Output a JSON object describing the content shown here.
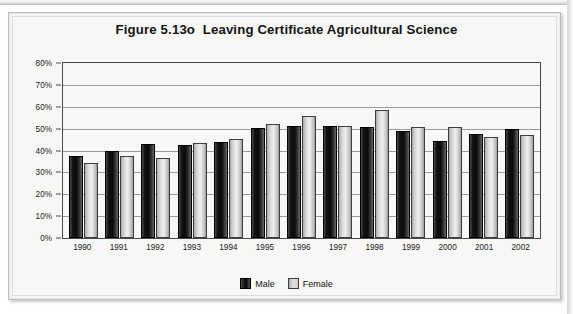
{
  "figure": {
    "title": "Figure 5.13o  Leaving Certificate Agricultural Science"
  },
  "legend": {
    "male_label": "Male",
    "female_label": "Female"
  },
  "colors": {
    "male": "#0b0b0b",
    "female": "#d8d8d8",
    "grid": "#9b9b9b",
    "axis": "#4a4a4a",
    "background": "#f7f7f5",
    "frame": "#bdbdbd"
  },
  "chart_data": {
    "type": "bar",
    "title": "Figure 5.13o  Leaving Certificate Agricultural Science",
    "xlabel": "",
    "ylabel": "",
    "ylim": [
      0,
      80
    ],
    "ytick_labels": [
      "80%",
      "70%",
      "60%",
      "50%",
      "40%",
      "30%",
      "20%",
      "10%",
      "0%"
    ],
    "ytick_values": [
      80,
      70,
      60,
      50,
      40,
      30,
      20,
      10,
      0
    ],
    "grid": true,
    "legend_position": "bottom",
    "value_suffix": "%",
    "categories": [
      "1990",
      "1991",
      "1992",
      "1993",
      "1994",
      "1995",
      "1996",
      "1997",
      "1998",
      "1999",
      "2000",
      "2001",
      "2002"
    ],
    "series": [
      {
        "name": "Male",
        "values": [
          37.5,
          39.7,
          42.8,
          42.5,
          44.1,
          50.4,
          51.3,
          51.0,
          50.8,
          49.0,
          44.5,
          47.4,
          49.7
        ]
      },
      {
        "name": "Female",
        "values": [
          34.5,
          37.6,
          36.8,
          43.4,
          45.2,
          52.1,
          56.0,
          51.4,
          58.3,
          50.7,
          50.7,
          46.3,
          47.3
        ]
      }
    ]
  }
}
